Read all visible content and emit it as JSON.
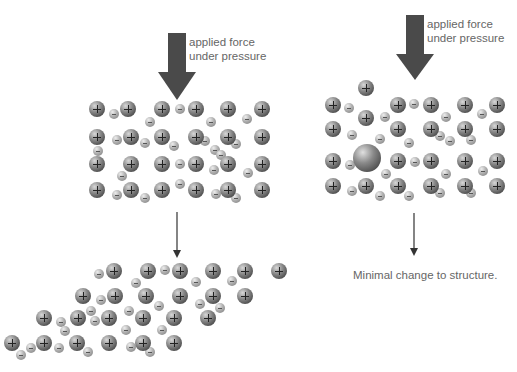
{
  "labels": {
    "left_force": [
      "applied force",
      "under pressure"
    ],
    "right_force": [
      "applied force",
      "under pressure"
    ],
    "right_result": "Minimal change to structure."
  },
  "colors": {
    "arrow": "#4a4a4a",
    "text": "#666666"
  },
  "left_lattice": {
    "pos": [
      [
        97,
        109
      ],
      [
        128,
        109
      ],
      [
        162,
        109
      ],
      [
        196,
        109
      ],
      [
        228,
        109
      ],
      [
        262,
        109
      ],
      [
        97,
        137
      ],
      [
        131,
        137
      ],
      [
        162,
        137
      ],
      [
        196,
        137
      ],
      [
        228,
        137
      ],
      [
        262,
        137
      ],
      [
        97,
        164
      ],
      [
        131,
        164
      ],
      [
        162,
        164
      ],
      [
        196,
        164
      ],
      [
        228,
        164
      ],
      [
        262,
        164
      ],
      [
        97,
        190
      ],
      [
        131,
        190
      ],
      [
        162,
        190
      ],
      [
        196,
        190
      ],
      [
        228,
        190
      ],
      [
        262,
        190
      ]
    ],
    "neg": [
      [
        114,
        114
      ],
      [
        180,
        109
      ],
      [
        150,
        122
      ],
      [
        211,
        122
      ],
      [
        247,
        119
      ],
      [
        117,
        140
      ],
      [
        145,
        143
      ],
      [
        174,
        146
      ],
      [
        205,
        141
      ],
      [
        215,
        150
      ],
      [
        236,
        144
      ],
      [
        98,
        151
      ],
      [
        221,
        155
      ],
      [
        122,
        176
      ],
      [
        180,
        164
      ],
      [
        214,
        170
      ],
      [
        248,
        173
      ],
      [
        117,
        195
      ],
      [
        145,
        198
      ],
      [
        180,
        184
      ],
      [
        216,
        194
      ],
      [
        236,
        198
      ]
    ]
  },
  "right_lattice": {
    "pos": [
      [
        366,
        88
      ],
      [
        333,
        105
      ],
      [
        398,
        105
      ],
      [
        431,
        105
      ],
      [
        465,
        105
      ],
      [
        497,
        105
      ],
      [
        366,
        118
      ],
      [
        333,
        129
      ],
      [
        398,
        129
      ],
      [
        431,
        129
      ],
      [
        465,
        129
      ],
      [
        497,
        129
      ],
      [
        333,
        161
      ],
      [
        398,
        161
      ],
      [
        431,
        161
      ],
      [
        465,
        161
      ],
      [
        497,
        161
      ],
      [
        333,
        186
      ],
      [
        366,
        186
      ],
      [
        398,
        186
      ],
      [
        431,
        186
      ],
      [
        465,
        186
      ],
      [
        497,
        186
      ]
    ],
    "neg": [
      [
        349,
        108
      ],
      [
        414,
        104
      ],
      [
        385,
        117
      ],
      [
        446,
        117
      ],
      [
        482,
        114
      ],
      [
        352,
        135
      ],
      [
        380,
        139
      ],
      [
        409,
        143
      ],
      [
        440,
        136
      ],
      [
        450,
        141
      ],
      [
        471,
        140
      ],
      [
        350,
        165
      ],
      [
        415,
        162
      ],
      [
        386,
        174
      ],
      [
        446,
        174
      ],
      [
        483,
        171
      ],
      [
        352,
        191
      ],
      [
        380,
        196
      ],
      [
        409,
        196
      ],
      [
        440,
        193
      ],
      [
        471,
        193
      ]
    ],
    "big": [
      [
        367,
        158
      ]
    ]
  },
  "sheared_lattice": {
    "pos": [
      [
        114,
        271
      ],
      [
        148,
        271
      ],
      [
        180,
        271
      ],
      [
        213,
        271
      ],
      [
        245,
        271
      ],
      [
        279,
        271
      ],
      [
        83,
        296
      ],
      [
        115,
        296
      ],
      [
        146,
        296
      ],
      [
        180,
        296
      ],
      [
        213,
        296
      ],
      [
        245,
        296
      ],
      [
        44,
        318
      ],
      [
        78,
        318
      ],
      [
        109,
        318
      ],
      [
        143,
        318
      ],
      [
        174,
        318
      ],
      [
        208,
        318
      ],
      [
        12,
        343
      ],
      [
        44,
        343
      ],
      [
        77,
        343
      ],
      [
        109,
        343
      ],
      [
        143,
        343
      ],
      [
        174,
        343
      ]
    ],
    "neg": [
      [
        99,
        274
      ],
      [
        165,
        270
      ],
      [
        136,
        283
      ],
      [
        196,
        282
      ],
      [
        232,
        281
      ],
      [
        101,
        300
      ],
      [
        91,
        311
      ],
      [
        129,
        311
      ],
      [
        159,
        306
      ],
      [
        200,
        304
      ],
      [
        220,
        308
      ],
      [
        95,
        321
      ],
      [
        61,
        322
      ],
      [
        126,
        330
      ],
      [
        162,
        330
      ],
      [
        65,
        331
      ],
      [
        31,
        348
      ],
      [
        59,
        348
      ],
      [
        88,
        352
      ],
      [
        131,
        347
      ],
      [
        150,
        352
      ],
      [
        21,
        355
      ]
    ]
  },
  "arrows": {
    "left_big": {
      "x": 177,
      "y1": 33,
      "y2": 100
    },
    "right_big": {
      "x": 415,
      "y1": 15,
      "y2": 80
    },
    "left_thin": {
      "x": 177,
      "y1": 212,
      "y2": 257
    },
    "right_thin": {
      "x": 414,
      "y1": 213,
      "y2": 255
    }
  }
}
